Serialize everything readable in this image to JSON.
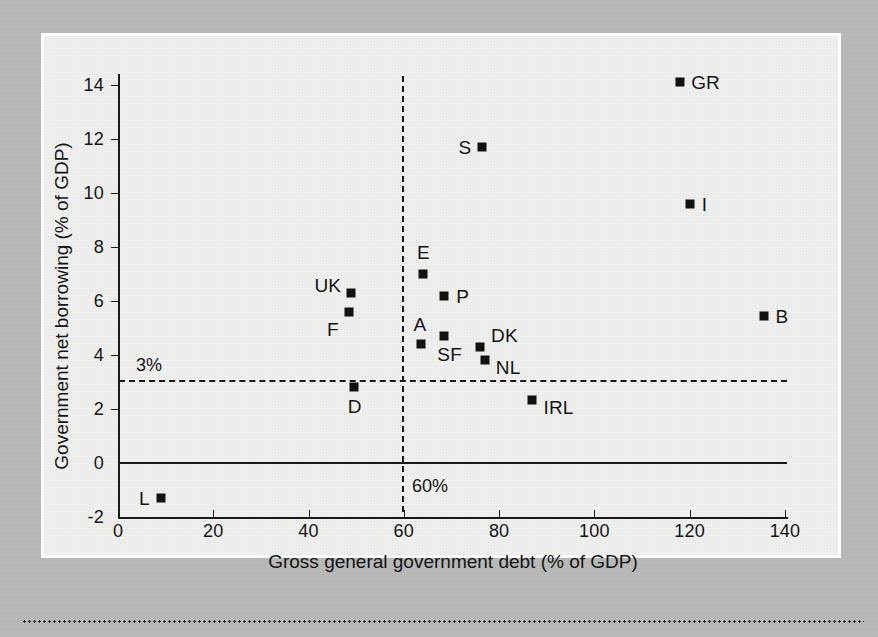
{
  "figure": {
    "panel_background": "#efefee",
    "page_background": "#b9b9b9",
    "marker_color": "#111111"
  },
  "chart_data": {
    "type": "scatter",
    "title": "",
    "xlabel": "Gross general government debt (% of GDP)",
    "ylabel": "Government net borrowing (% of GDP)",
    "xlim": [
      0,
      147
    ],
    "ylim": [
      -2,
      15
    ],
    "xticks": [
      0,
      20,
      40,
      60,
      80,
      100,
      120,
      140
    ],
    "xticklabels": [
      "0",
      "20",
      "40",
      "60",
      "80",
      "100",
      "120",
      "140"
    ],
    "yticks": [
      -2,
      0,
      2,
      4,
      6,
      8,
      10,
      12,
      14
    ],
    "yticklabels": [
      "-2",
      "0",
      "2",
      "4",
      "6",
      "8",
      "10",
      "12",
      "14"
    ],
    "grid": false,
    "legend": "none",
    "reference_lines": [
      {
        "name": "three-percent-deficit-limit",
        "orientation": "horizontal",
        "value": 3,
        "label": "3%",
        "style": "dashed"
      },
      {
        "name": "sixty-percent-debt-limit",
        "orientation": "vertical",
        "value": 60,
        "label": "60%",
        "style": "dashed"
      },
      {
        "name": "zero-line",
        "orientation": "horizontal",
        "value": 0,
        "label": "",
        "style": "solid"
      }
    ],
    "points": [
      {
        "label": "L",
        "x": 9,
        "y": -1.3,
        "label_dx": -22,
        "label_dy": -10
      },
      {
        "label": "GR",
        "x": 118,
        "y": 14.1,
        "label_dx": 11,
        "label_dy": -10
      },
      {
        "label": "S",
        "x": 76.5,
        "y": 11.7,
        "label_dx": -24,
        "label_dy": -10
      },
      {
        "label": "I",
        "x": 120,
        "y": 9.6,
        "label_dx": 12,
        "label_dy": -10
      },
      {
        "label": "B",
        "x": 135.5,
        "y": 5.45,
        "label_dx": 12,
        "label_dy": -10
      },
      {
        "label": "E",
        "x": 64,
        "y": 7.0,
        "label_dx": -6,
        "label_dy": -32
      },
      {
        "label": "P",
        "x": 68.5,
        "y": 6.2,
        "label_dx": 12,
        "label_dy": -10
      },
      {
        "label": "UK",
        "x": 49,
        "y": 6.3,
        "label_dx": -37,
        "label_dy": -18
      },
      {
        "label": "F",
        "x": 48.5,
        "y": 5.6,
        "label_dx": -22,
        "label_dy": 7
      },
      {
        "label": "SF",
        "x": 68.5,
        "y": 4.7,
        "label_dx": -7,
        "label_dy": 8
      },
      {
        "label": "A",
        "x": 63.5,
        "y": 4.4,
        "label_dx": -7,
        "label_dy": -30
      },
      {
        "label": "DK",
        "x": 76,
        "y": 4.3,
        "label_dx": 11,
        "label_dy": -22
      },
      {
        "label": "NL",
        "x": 77,
        "y": 3.8,
        "label_dx": 11,
        "label_dy": -3
      },
      {
        "label": "D",
        "x": 49.5,
        "y": 2.8,
        "label_dx": -6,
        "label_dy": 9
      },
      {
        "label": "IRL",
        "x": 87,
        "y": 2.35,
        "label_dx": 11,
        "label_dy": -3
      }
    ]
  }
}
